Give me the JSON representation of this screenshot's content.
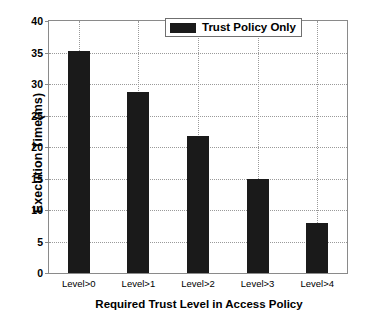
{
  "chart_data": {
    "type": "bar",
    "title": "",
    "xlabel": "Required Trust Level in Access Policy",
    "ylabel": "Execution Time(ms)",
    "categories": [
      "Level>0",
      "Level>1",
      "Level>2",
      "Level>3",
      "Level>4"
    ],
    "values": [
      35.3,
      28.8,
      21.8,
      15.0,
      8.0
    ],
    "series": [
      {
        "name": "Trust Policy Only",
        "values": [
          35.3,
          28.8,
          21.8,
          15.0,
          8.0
        ],
        "color": "#1a1a1a"
      }
    ],
    "ylim": [
      0,
      40
    ],
    "yticks": [
      0,
      5,
      10,
      15,
      20,
      25,
      30,
      35,
      40
    ],
    "ytick_labels": [
      "0",
      "5",
      "10",
      "15",
      "20",
      "25",
      "30",
      "35",
      "40"
    ],
    "grid": true,
    "grid_style": "dotted",
    "grid_color": "#9a9a9a",
    "legend": {
      "position": "top-right",
      "entries": [
        "Trust Policy Only"
      ]
    },
    "bar_color": "#1a1a1a",
    "background_color": "#ffffff",
    "axis_color": "#8a8a8a"
  }
}
